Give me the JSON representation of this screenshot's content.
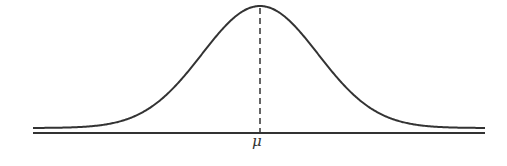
{
  "diagram": {
    "type": "normal-distribution-curve",
    "labels": {
      "mean": "μ"
    },
    "colors": {
      "curve": "#333333",
      "axis": "#333333",
      "mean_line": "#333333",
      "background": "#ffffff"
    },
    "geometry": {
      "axis": {
        "x1": 33,
        "x2": 485,
        "y": 133
      },
      "curve": {
        "x_start": 33,
        "x_end": 485,
        "peak_x": 260,
        "peak_y": 6,
        "tail_y": 128,
        "sigma_px": 58
      },
      "mean_line": {
        "x": 260,
        "y1": 8,
        "y2": 133
      },
      "mean_label": {
        "x": 252,
        "y": 134
      }
    }
  }
}
